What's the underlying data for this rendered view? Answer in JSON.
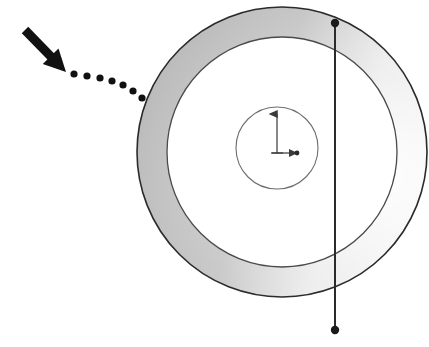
{
  "figure": {
    "canvas": {
      "width": 429,
      "height": 347,
      "background": "#ffffff"
    },
    "annulus": {
      "name": "shaded-annulus",
      "center_x": 282,
      "center_y": 152,
      "outer_radius": 145,
      "inner_radius": 115,
      "outline_color": "#2b2b2b",
      "outline_width": 1.6,
      "shading": {
        "type": "angular-gradient",
        "dark_color": "#9a9a9a",
        "mid_color": "#bfbfbf",
        "light_color": "#f2f2f2",
        "highlight_angle_deg": 0,
        "highlight_position": "right"
      }
    },
    "inner_disc": {
      "name": "inner-small-circle",
      "center_x": 277,
      "center_y": 148,
      "radius": 41,
      "fill": "#ffffff",
      "outline_color": "#6e6e6e",
      "outline_width": 1.1
    },
    "axes": {
      "name": "coordinate-axes",
      "origin_x": 277,
      "origin_y": 153,
      "vertical_arrow": {
        "label": "up-axis",
        "from_y": 153,
        "to_y": 112,
        "direction": "up"
      },
      "horizontal_arrow": {
        "label": "right-axis",
        "from_x": 277,
        "to_x": 300,
        "direction": "right"
      },
      "tip_dot": {
        "x": 297,
        "y": 153,
        "radius": 2.4
      },
      "color": "#3a3a3a",
      "stroke_width": 1.2
    },
    "chord_line": {
      "name": "vertical-chord-line",
      "x": 335,
      "y_top": 23,
      "y_bottom": 330,
      "color": "#2b2b2b",
      "width": 2.0,
      "endpoint_dots": [
        {
          "label": "top-node",
          "x": 335,
          "y": 23,
          "radius": 4.2
        },
        {
          "label": "bottom-node",
          "x": 335,
          "y": 330,
          "radius": 4.2
        }
      ]
    },
    "callout": {
      "name": "pointer-callout",
      "arrow": {
        "label": "black-arrow",
        "tail_x": 25,
        "tail_y": 30,
        "tip_x": 66,
        "tip_y": 72,
        "shaft_width": 9,
        "head_length": 22,
        "head_width": 22,
        "color": "#111111"
      },
      "dotted_trail": {
        "label": "dotted-leader",
        "color": "#111111",
        "dot_radius": 3.6,
        "dots": [
          {
            "x": 74,
            "y": 74
          },
          {
            "x": 87,
            "y": 76
          },
          {
            "x": 100,
            "y": 78
          },
          {
            "x": 112,
            "y": 81
          },
          {
            "x": 123,
            "y": 85
          },
          {
            "x": 133,
            "y": 91
          },
          {
            "x": 142,
            "y": 98
          }
        ]
      }
    }
  }
}
